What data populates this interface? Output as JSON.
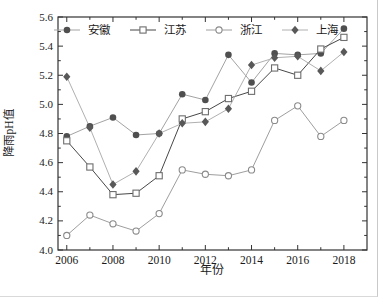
{
  "figure": {
    "background": "#ffffff",
    "frame_color": "#333333"
  },
  "chart_data": {
    "type": "line",
    "title": "",
    "xlabel": "年份",
    "ylabel": "降雨pH值",
    "x": [
      2006,
      2007,
      2008,
      2009,
      2010,
      2011,
      2012,
      2013,
      2014,
      2015,
      2016,
      2017,
      2018
    ],
    "xlim": [
      2005.62,
      2019.0
    ],
    "ylim": [
      4.0,
      5.6
    ],
    "y_major_step": 0.2,
    "y_minor_step": 0.1,
    "x_major_tick_step": 2,
    "x_tick_labels": [
      "2006",
      "2008",
      "2010",
      "2012",
      "2014",
      "2016",
      "2018"
    ],
    "y_tick_labels": [
      "4.0",
      "4.2",
      "4.4",
      "4.6",
      "4.8",
      "5.0",
      "5.2",
      "5.4",
      "5.6"
    ],
    "grid": false,
    "legend_position": "top-inside",
    "series": [
      {
        "id": "anhui",
        "name": "安徽",
        "marker": "filled-circle",
        "marker_color": "#4f4f4f",
        "line_color": "#a3a3a3",
        "values": [
          4.78,
          4.85,
          4.91,
          4.79,
          4.8,
          5.07,
          5.03,
          5.34,
          5.15,
          5.35,
          5.34,
          5.35,
          5.52
        ]
      },
      {
        "id": "jiangsu",
        "name": "江苏",
        "marker": "open-square",
        "marker_color": "#6e6e6e",
        "line_color": "#474747",
        "values": [
          4.75,
          4.57,
          4.38,
          4.39,
          4.51,
          4.9,
          4.95,
          5.04,
          5.09,
          5.25,
          5.2,
          5.38,
          5.46
        ]
      },
      {
        "id": "zhejiang",
        "name": "浙江",
        "marker": "open-circle",
        "marker_color": "#8a8a8a",
        "line_color": "#9e9e9e",
        "values": [
          4.1,
          4.24,
          4.18,
          4.13,
          4.25,
          4.55,
          4.52,
          4.51,
          4.55,
          4.89,
          4.99,
          4.78,
          4.89
        ]
      },
      {
        "id": "shanghai",
        "name": "上海",
        "marker": "filled-diamond",
        "marker_color": "#585858",
        "line_color": "#b0b0b0",
        "values": [
          5.19,
          4.84,
          4.45,
          4.54,
          4.8,
          4.87,
          4.88,
          4.97,
          5.27,
          5.32,
          5.33,
          5.23,
          5.36
        ]
      }
    ]
  }
}
